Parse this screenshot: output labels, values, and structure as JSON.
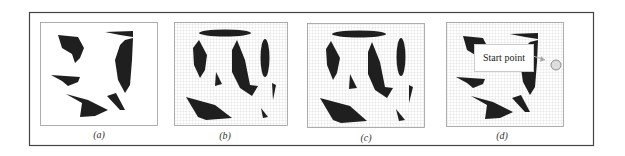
{
  "figure": {
    "panels": [
      {
        "id": "a",
        "caption": "(a)",
        "grid": false,
        "description": "Obstacle map without grid"
      },
      {
        "id": "b",
        "caption": "(b)",
        "grid": true,
        "description": "Obstacles on grid with added ellipses"
      },
      {
        "id": "c",
        "caption": "(c)",
        "grid": true,
        "description": "Obstacles on grid with ellipses (variant)"
      },
      {
        "id": "d",
        "caption": "(d)",
        "grid": true,
        "description": "Grid map with start point marked"
      }
    ],
    "annotation": {
      "label": "Start point",
      "marker": "circle-start-marker"
    },
    "colors": {
      "obstacle": "#1f1f1f",
      "grid": "#c8c8c8",
      "frame": "#444444",
      "background": "#ffffff",
      "panel_border": "#888888",
      "start_marker": "#d8d8d8",
      "arrow": "#aaaaaa"
    }
  }
}
